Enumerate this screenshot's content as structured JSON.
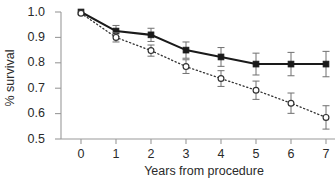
{
  "chart_data": {
    "type": "line",
    "title": "",
    "subtitle": "",
    "xlabel": "Years from procedure",
    "ylabel": "% survival",
    "x": [
      0,
      1,
      2,
      3,
      4,
      5,
      6,
      7
    ],
    "xticklabels": [
      "0",
      "1",
      "2",
      "3",
      "4",
      "5",
      "6",
      "7"
    ],
    "yticks": [
      0.5,
      0.6,
      0.7,
      0.8,
      0.9,
      1.0
    ],
    "yticklabels": [
      "0.5",
      "0.6",
      "0.7",
      "0.8",
      "0.9",
      "1.0"
    ],
    "xlim": [
      -0.35,
      7.15
    ],
    "ylim": [
      0.5,
      1.0
    ],
    "grid": false,
    "legend": "none",
    "series": [
      {
        "name": "solid-filled-square",
        "marker": "filled-square",
        "linestyle": "solid",
        "color": "#1a1a1a",
        "values": [
          1.0,
          0.925,
          0.91,
          0.85,
          0.823,
          0.795,
          0.795,
          0.795
        ],
        "err_lower": [
          0.0,
          0.022,
          0.026,
          0.032,
          0.037,
          0.043,
          0.046,
          0.05
        ],
        "err_upper": [
          0.0,
          0.022,
          0.026,
          0.032,
          0.037,
          0.043,
          0.046,
          0.05
        ]
      },
      {
        "name": "dotted-open-circle",
        "marker": "open-circle",
        "linestyle": "dotted",
        "color": "#333333",
        "values": [
          0.995,
          0.9,
          0.848,
          0.785,
          0.738,
          0.692,
          0.641,
          0.585
        ],
        "err_lower": [
          0.0,
          0.018,
          0.022,
          0.027,
          0.031,
          0.036,
          0.04,
          0.046
        ],
        "err_upper": [
          0.0,
          0.018,
          0.022,
          0.027,
          0.031,
          0.036,
          0.04,
          0.046
        ]
      }
    ]
  },
  "axis": {
    "axis_color": "#9a9a9a",
    "text_color": "#2a2a2a"
  }
}
